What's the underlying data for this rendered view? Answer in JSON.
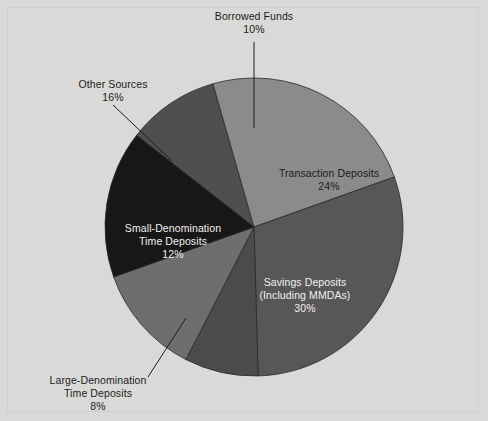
{
  "figure": {
    "background_color": "#d9d9d7",
    "frame_color": "#cfcfcd"
  },
  "chart_data": {
    "type": "pie",
    "title": "",
    "subtitle": "",
    "xlabel": "",
    "ylabel": "",
    "legend_position": "none",
    "grid": false,
    "unit": "percent",
    "total": 100,
    "categories": [
      "Borrowed Funds",
      "Transaction Deposits",
      "Savings Deposits (Including MMDAs)",
      "Large-Denomination Time Deposits",
      "Small-Denomination Time Deposits",
      "Other Sources"
    ],
    "values": [
      10,
      24,
      30,
      8,
      12,
      16
    ],
    "slices": [
      {
        "id": "borrowed-funds",
        "name": "Borrowed Funds",
        "value": 10,
        "value_text": "10%",
        "color": "#4f4f4f",
        "start_angle": -52,
        "end_angle": -16,
        "label_placement": "outside",
        "label_lines": [
          "Borrowed Funds",
          "10%"
        ]
      },
      {
        "id": "transaction-deposits",
        "name": "Transaction Deposits",
        "value": 24,
        "value_text": "24%",
        "color": "#8b8b8b",
        "start_angle": -16,
        "end_angle": 70.4,
        "label_placement": "inside",
        "label_lines": [
          "Transaction Deposits",
          "24%"
        ]
      },
      {
        "id": "savings-deposits",
        "name": "Savings Deposits (Including MMDAs)",
        "value": 30,
        "value_text": "30%",
        "color": "#575757",
        "start_angle": 70.4,
        "end_angle": 178.4,
        "label_placement": "inside",
        "label_lines": [
          "Savings Deposits",
          "(Including MMDAs)",
          "30%"
        ]
      },
      {
        "id": "large-denomination-time-deposits",
        "name": "Large-Denomination Time Deposits",
        "value": 8,
        "value_text": "8%",
        "color": "#4b4b4b",
        "start_angle": 178.4,
        "end_angle": 207.2,
        "label_placement": "outside",
        "label_lines": [
          "Large-Denomination",
          "Time Deposits",
          "8%"
        ]
      },
      {
        "id": "small-denomination-time-deposits",
        "name": "Small-Denomination Time Deposits",
        "value": 12,
        "value_text": "12%",
        "color": "#6e6e6e",
        "start_angle": 207.2,
        "end_angle": 250.4,
        "label_placement": "inside",
        "label_lines": [
          "Small-Denomination",
          "Time Deposits",
          "12%"
        ]
      },
      {
        "id": "other-sources",
        "name": "Other Sources",
        "value": 16,
        "value_text": "16%",
        "color": "#171717",
        "start_angle": 250.4,
        "end_angle": 308,
        "label_placement": "outside",
        "label_lines": [
          "Other Sources",
          "16%"
        ]
      }
    ],
    "geometry": {
      "center_x": 254,
      "center_y": 227,
      "radius": 149
    }
  },
  "labels": {
    "borrowed_funds": {
      "line1": "Borrowed Funds",
      "line2": "10%"
    },
    "other_sources": {
      "line1": "Other Sources",
      "line2": "16%"
    },
    "transaction_deposits": {
      "line1": "Transaction Deposits",
      "line2": "24%"
    },
    "savings_deposits": {
      "line1": "Savings Deposits",
      "line2": "(Including MMDAs)",
      "line3": "30%"
    },
    "small_denomination": {
      "line1": "Small-Denomination",
      "line2": "Time Deposits",
      "line3": "12%"
    },
    "large_denomination": {
      "line1": "Large-Denomination",
      "line2": "Time Deposits",
      "line3": "8%"
    }
  }
}
